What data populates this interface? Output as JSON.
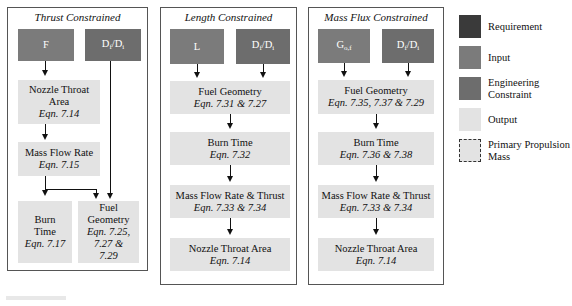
{
  "colors": {
    "requirement": "#3a3a3a",
    "input": "#7b7b7b",
    "engineering_constraint": "#6d6d6d",
    "output": "#e3e3e3",
    "border": "#555555"
  },
  "panels": [
    {
      "title": "Thrust Constrained",
      "inputs": [
        {
          "label": "F",
          "type": "input"
        },
        {
          "label": "Df/Di",
          "type": "engineering_constraint"
        }
      ],
      "outputs": [
        {
          "label": "Nozzle Throat Area",
          "eqn": "Eqn. 7.14"
        },
        {
          "label": "Mass Flow Rate",
          "eqn": "Eqn. 7.15"
        },
        {
          "label": "Burn Time",
          "eqn": "Eqn. 7.17"
        },
        {
          "label": "Fuel Geometry",
          "eqn": "Eqn. 7.25, 7.27 & 7.29"
        }
      ]
    },
    {
      "title": "Length Constrained",
      "inputs": [
        {
          "label": "L",
          "type": "input"
        },
        {
          "label": "Df/Di",
          "type": "engineering_constraint"
        }
      ],
      "outputs": [
        {
          "label": "Fuel Geometry",
          "eqn": "Eqn. 7.31 & 7.27"
        },
        {
          "label": "Burn Time",
          "eqn": "Eqn. 7.32"
        },
        {
          "label": "Mass Flow Rate & Thrust",
          "eqn": "Eqn. 7.33 & 7.34"
        },
        {
          "label": "Nozzle Throat Area",
          "eqn": "Eqn. 7.14"
        }
      ]
    },
    {
      "title": "Mass Flux Constrained",
      "inputs": [
        {
          "label": "Go,f",
          "type": "input"
        },
        {
          "label": "Df/Di",
          "type": "engineering_constraint"
        }
      ],
      "outputs": [
        {
          "label": "Fuel Geometry",
          "eqn": "Eqn. 7.35, 7.37 & 7.29"
        },
        {
          "label": "Burn Time",
          "eqn": "Eqn. 7.36 & 7.38"
        },
        {
          "label": "Mass Flow Rate & Thrust",
          "eqn": "Eqn. 7.33 & 7.34"
        },
        {
          "label": "Nozzle Throat Area",
          "eqn": "Eqn. 7.14"
        }
      ]
    }
  ],
  "legend": [
    {
      "label": "Requirement",
      "style": "requirement"
    },
    {
      "label": "Input",
      "style": "input"
    },
    {
      "label": "Engineering Constraint",
      "style": "engineering_constraint"
    },
    {
      "label": "Output",
      "style": "output"
    },
    {
      "label": "Primary Propulsion Mass",
      "style": "dashed"
    }
  ],
  "text": {
    "p1_title": "Thrust Constrained",
    "p2_title": "Length Constrained",
    "p3_title": "Mass Flux Constrained",
    "F": "F",
    "L": "L",
    "G": "G",
    "G_sub": "o,f",
    "D": "D",
    "D_sub_f": "f",
    "slash_D": "/D",
    "D_sub_i": "i",
    "nozzle_throat": "Nozzle Throat",
    "area": "Area",
    "nozzle_throat_area": "Nozzle Throat Area",
    "eqn_714": "Eqn. 7.14",
    "mass_flow_rate": "Mass Flow Rate",
    "eqn_715": "Eqn. 7.15",
    "burn": "Burn",
    "time": "Time",
    "burn_time": "Burn Time",
    "eqn_717": "Eqn. 7.17",
    "fuel": "Fuel",
    "geometry": "Geometry",
    "fuel_geometry": "Fuel Geometry",
    "eqn_725": "Eqn. 7.25,",
    "eqn_727and": "7.27 &",
    "eqn_729": "7.29",
    "eqn_731": "Eqn. 7.31 & 7.27",
    "eqn_732": "Eqn. 7.32",
    "mfr_thrust": "Mass Flow Rate & Thrust",
    "eqn_733": "Eqn. 7.33 & 7.34",
    "eqn_735": "Eqn. 7.35, 7.37 & 7.29",
    "eqn_736": "Eqn. 7.36 & 7.38",
    "leg_req": "Requirement",
    "leg_input": "Input",
    "leg_eng1": "Engineering",
    "leg_eng2": "Constraint",
    "leg_out": "Output",
    "leg_ppm1": "Primary Propulsion",
    "leg_ppm2": "Mass"
  }
}
